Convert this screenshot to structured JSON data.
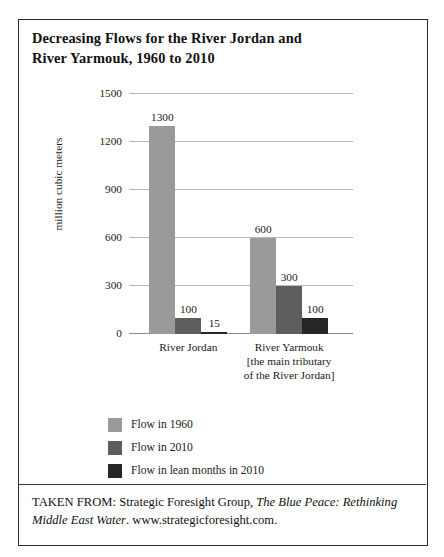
{
  "figure": {
    "title_line1": "Decreasing Flows for the River Jordan and",
    "title_line2": "River Yarmouk, 1960 to 2010",
    "source_prefix": "TAKEN FROM: Strategic Foresight Group, ",
    "source_italic1": "The Blue Peace:",
    "source_italic2": "Rethinking Middle East Water",
    "source_suffix": ". www.strategicforesight.com."
  },
  "chart_data": {
    "type": "bar",
    "title": "Decreasing Flows for the River Jordan and River Yarmouk, 1960 to 2010",
    "xlabel": "",
    "ylabel": "million cubic meters",
    "ylim": [
      0,
      1500
    ],
    "yticks": [
      0,
      300,
      600,
      900,
      1200,
      1500
    ],
    "ytick_labels": [
      "0",
      "300",
      "600",
      "900",
      "1200",
      "1500"
    ],
    "grid": true,
    "legend_position": "below-center",
    "categories": [
      "River Jordan",
      "River Yarmouk"
    ],
    "category_labels": [
      [
        "River Jordan"
      ],
      [
        "River Yarmouk",
        "[the main tributary",
        "of the River Jordan]"
      ]
    ],
    "series": [
      {
        "name": "Flow in 1960",
        "color": "#9a9a9a",
        "values": [
          1300,
          600
        ],
        "value_labels": [
          "1300",
          "600"
        ]
      },
      {
        "name": "Flow in 2010",
        "color": "#5e5e5e",
        "values": [
          100,
          300
        ],
        "value_labels": [
          "100",
          "300"
        ]
      },
      {
        "name": "Flow in lean months in 2010",
        "color": "#262626",
        "values": [
          15,
          100
        ],
        "value_labels": [
          "15",
          "100"
        ]
      }
    ]
  },
  "legend": {
    "items": [
      {
        "label": "Flow in 1960",
        "color": "#9a9a9a"
      },
      {
        "label": "Flow in 2010",
        "color": "#5e5e5e"
      },
      {
        "label": "Flow in lean months in 2010",
        "color": "#262626"
      }
    ]
  }
}
